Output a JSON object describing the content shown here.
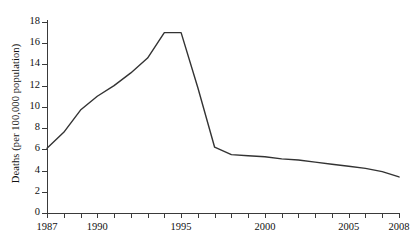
{
  "chart_data": {
    "type": "line",
    "title": "",
    "xlabel": "",
    "ylabel": "Deaths (per 100,000 population)",
    "xlim": [
      1987,
      2008
    ],
    "ylim": [
      0,
      18
    ],
    "ytick_step": 2,
    "grid": false,
    "legend": null,
    "line_color": "#333333",
    "x": [
      1987,
      1988,
      1989,
      1990,
      1991,
      1992,
      1993,
      1994,
      1995,
      1996,
      1997,
      1998,
      1999,
      2000,
      2001,
      2002,
      2003,
      2004,
      2005,
      2006,
      2007,
      2008
    ],
    "values": [
      6.1,
      7.6,
      9.7,
      11.0,
      12.0,
      13.2,
      14.6,
      17.0,
      17.0,
      11.8,
      6.2,
      5.5,
      5.4,
      5.3,
      5.1,
      5.0,
      4.8,
      4.6,
      4.4,
      4.2,
      3.9,
      3.4
    ],
    "ytick_labels": [
      "0",
      "2",
      "4",
      "6",
      "8",
      "10",
      "12",
      "14",
      "16",
      "18"
    ],
    "ytick_values": [
      0,
      2,
      4,
      6,
      8,
      10,
      12,
      14,
      16,
      18
    ],
    "xtick_values": [
      1987,
      1988,
      1989,
      1990,
      1991,
      1992,
      1993,
      1994,
      1995,
      1996,
      1997,
      1998,
      1999,
      2000,
      2001,
      2002,
      2003,
      2004,
      2005,
      2006,
      2007,
      2008
    ],
    "xtick_labeled": [
      1987,
      1990,
      1995,
      2000,
      2005,
      2008
    ],
    "xtick_labels": [
      "1987",
      "1990",
      "1995",
      "2000",
      "2005",
      "2008"
    ]
  }
}
